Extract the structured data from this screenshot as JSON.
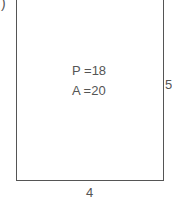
{
  "diagram": {
    "label_fragment": ")",
    "shape": "rectangle",
    "perimeter_label": "P =18",
    "area_label": "A =20",
    "side_right_label": "5",
    "side_bottom_label": "4",
    "stroke_color": "#555555"
  }
}
